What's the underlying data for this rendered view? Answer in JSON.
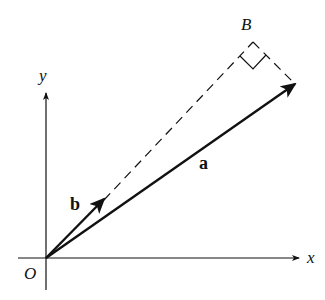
{
  "diagram": {
    "type": "vector-projection",
    "labels": {
      "origin": "O",
      "x_axis": "x",
      "y_axis": "y",
      "vector_a": "a",
      "vector_b": "b",
      "point_B": "B"
    },
    "colors": {
      "stroke": "#111111",
      "background": "#ffffff"
    }
  }
}
